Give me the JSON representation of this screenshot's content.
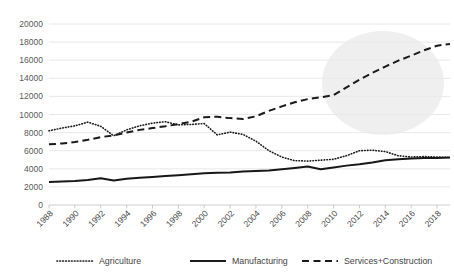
{
  "chart_data": {
    "type": "line",
    "title": "",
    "subtitle": "",
    "xlabel": "",
    "ylabel": "",
    "xlim": [
      1988,
      2019
    ],
    "ylim": [
      0,
      20000
    ],
    "grid": true,
    "legend_position": "bottom",
    "ytick_labels": [
      "20000",
      "18000",
      "16000",
      "14000",
      "12000",
      "10000",
      "8000",
      "6000",
      "4000",
      "2000",
      "0"
    ],
    "ytick_values": [
      20000,
      18000,
      16000,
      14000,
      12000,
      10000,
      8000,
      6000,
      4000,
      2000,
      0
    ],
    "xtick_labels": [
      "1988",
      "1990",
      "1992",
      "1994",
      "1996",
      "1998",
      "2000",
      "2002",
      "2004",
      "2006",
      "2008",
      "2010",
      "2012",
      "2014",
      "2016",
      "2018"
    ],
    "xtick_values": [
      1988,
      1990,
      1992,
      1994,
      1996,
      1998,
      2000,
      2002,
      2004,
      2006,
      2008,
      2010,
      2012,
      2014,
      2016,
      2018
    ],
    "x": [
      1988,
      1989,
      1990,
      1991,
      1992,
      1993,
      1994,
      1995,
      1996,
      1997,
      1998,
      1999,
      2000,
      2001,
      2002,
      2003,
      2004,
      2005,
      2006,
      2007,
      2008,
      2009,
      2010,
      2011,
      2012,
      2013,
      2014,
      2015,
      2016,
      2017,
      2018,
      2019
    ],
    "series": [
      {
        "name": "Agriculture",
        "style": "dotted",
        "color": "#1a1a1a",
        "values": [
          8200,
          8500,
          8750,
          9150,
          8700,
          7650,
          8300,
          8750,
          9050,
          9200,
          8850,
          8900,
          9000,
          7750,
          8050,
          7800,
          7050,
          6000,
          5300,
          4900,
          4850,
          4950,
          5050,
          5450,
          6000,
          6050,
          5900,
          5450,
          5300,
          5350,
          5300,
          5250
        ]
      },
      {
        "name": "Manufacturing",
        "style": "solid",
        "color": "#171717",
        "values": [
          2550,
          2600,
          2650,
          2750,
          2950,
          2700,
          2900,
          3000,
          3100,
          3200,
          3300,
          3400,
          3500,
          3550,
          3600,
          3700,
          3750,
          3800,
          3950,
          4100,
          4250,
          3950,
          4150,
          4350,
          4500,
          4700,
          4950,
          5050,
          5150,
          5200,
          5200,
          5250
        ]
      },
      {
        "name": "Services+Construction",
        "style": "dashed",
        "color": "#1a1a1a",
        "values": [
          6700,
          6800,
          6950,
          7200,
          7500,
          7700,
          8000,
          8300,
          8500,
          8700,
          8950,
          9200,
          9700,
          9750,
          9600,
          9500,
          9800,
          10400,
          10900,
          11350,
          11700,
          11900,
          12150,
          13000,
          13850,
          14600,
          15300,
          15950,
          16500,
          17100,
          17600,
          17800
        ]
      }
    ],
    "annotations": [
      {
        "type": "highlight-circle",
        "shape": "ellipse",
        "note": "gray circular highlight over Services+Construction upper-right region"
      }
    ]
  },
  "legend": {
    "items": [
      {
        "label": "Agriculture",
        "style": "dotted"
      },
      {
        "label": "Manufacturing",
        "style": "solid"
      },
      {
        "label": "Services+Construction",
        "style": "dashed"
      }
    ]
  }
}
